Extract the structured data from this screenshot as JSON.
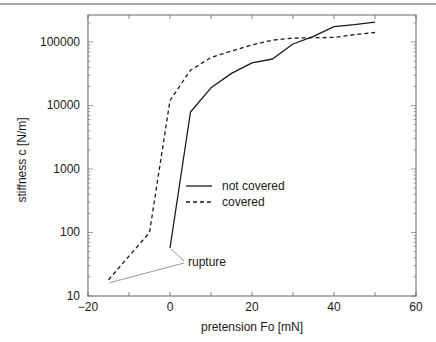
{
  "chart_data": {
    "type": "line",
    "title": "",
    "xlabel": "pretension Fo [mN]",
    "ylabel": "stiffness c [N/m]",
    "xlim": [
      -20,
      60
    ],
    "ylim": [
      10,
      266000
    ],
    "yscale": "log",
    "x_ticks": [
      -20,
      0,
      20,
      40,
      60
    ],
    "x_tick_labels": [
      "−20",
      "0",
      "20",
      "40",
      "60"
    ],
    "x_minor_ticks": [
      -10,
      10,
      30,
      50
    ],
    "y_ticks": [
      10,
      100,
      1000,
      10000,
      100000
    ],
    "y_tick_labels": [
      "10",
      "100",
      "1000",
      "10000",
      "100000"
    ],
    "grid": false,
    "legend_position": "center",
    "series": [
      {
        "name": "not covered",
        "style": "solid",
        "x": [
          0,
          5,
          10,
          15,
          20,
          25,
          30,
          35,
          40,
          45,
          50
        ],
        "y": [
          57,
          7900,
          19000,
          32000,
          47000,
          54000,
          93000,
          123000,
          174000,
          187000,
          205000
        ]
      },
      {
        "name": "covered",
        "style": "dashed",
        "x": [
          -15,
          -5,
          0,
          5,
          10,
          15,
          20,
          25,
          30,
          35,
          40,
          45,
          50
        ],
        "y": [
          18,
          100,
          12000,
          36000,
          57000,
          72000,
          90000,
          107000,
          115000,
          117000,
          118000,
          130000,
          141000
        ]
      }
    ],
    "annotations": [
      {
        "text": "rupture",
        "pointers": [
          {
            "x": 0,
            "y": 57
          },
          {
            "x": -15,
            "y": 18
          }
        ]
      }
    ]
  }
}
